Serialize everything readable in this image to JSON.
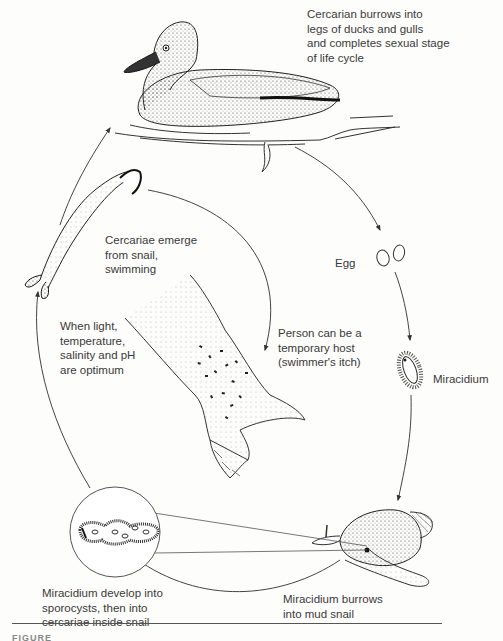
{
  "diagram": {
    "type": "life-cycle",
    "stages": [
      {
        "id": "duck",
        "label": "Cercarian burrows into\nlegs of ducks and gulls\nand completes sexual stage\nof life cycle"
      },
      {
        "id": "egg",
        "label": "Egg"
      },
      {
        "id": "miracidium",
        "label": "Miracidium"
      },
      {
        "id": "snail",
        "label": "Miracidium burrows\ninto mud snail"
      },
      {
        "id": "sporocyst",
        "label": "Miracidium develop into\nsporocysts, then into\ncercariae inside snail"
      },
      {
        "id": "cercariae",
        "label": "Cercariae emerge\nfrom snail,\nswimming"
      },
      {
        "id": "conditions",
        "label": "When light,\ntemperature,\nsalinity and pH\nare optimum"
      },
      {
        "id": "person",
        "label": "Person can be a\ntemporary host\n(swimmer's itch)"
      }
    ],
    "edges": [
      {
        "from": "duck",
        "to": "egg"
      },
      {
        "from": "egg",
        "to": "miracidium"
      },
      {
        "from": "miracidium",
        "to": "snail"
      },
      {
        "from": "snail",
        "to": "sporocyst"
      },
      {
        "from": "sporocyst",
        "to": "cercariae"
      },
      {
        "from": "cercariae",
        "to": "duck"
      },
      {
        "from": "cercariae",
        "to": "person"
      }
    ],
    "caption": "FIGURE"
  }
}
